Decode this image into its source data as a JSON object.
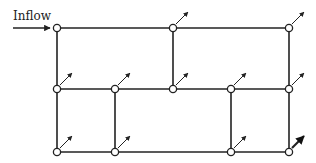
{
  "diagram": {
    "type": "pipe-network",
    "inflow_label": "Inflow",
    "colors": {
      "line": "#222222",
      "node_fill": "#ffffff",
      "background": "#ffffff"
    },
    "nodes": [
      {
        "id": "n1",
        "x": 57,
        "y": 28,
        "outflow": false,
        "inflow": true
      },
      {
        "id": "n2",
        "x": 173,
        "y": 28,
        "outflow": true
      },
      {
        "id": "n3",
        "x": 289,
        "y": 28,
        "outflow": true
      },
      {
        "id": "n4",
        "x": 57,
        "y": 89,
        "outflow": true
      },
      {
        "id": "n5",
        "x": 115,
        "y": 89,
        "outflow": true
      },
      {
        "id": "n6",
        "x": 173,
        "y": 89,
        "outflow": true
      },
      {
        "id": "n7",
        "x": 231,
        "y": 89,
        "outflow": true
      },
      {
        "id": "n8",
        "x": 289,
        "y": 89,
        "outflow": true
      },
      {
        "id": "n9",
        "x": 57,
        "y": 152,
        "outflow": true
      },
      {
        "id": "n10",
        "x": 115,
        "y": 152,
        "outflow": true
      },
      {
        "id": "n11",
        "x": 231,
        "y": 152,
        "outflow": true
      },
      {
        "id": "n12",
        "x": 289,
        "y": 152,
        "outflow": true,
        "bold": true
      }
    ],
    "edges": [
      [
        "n1",
        "n2"
      ],
      [
        "n2",
        "n3"
      ],
      [
        "n1",
        "n4"
      ],
      [
        "n2",
        "n6"
      ],
      [
        "n3",
        "n8"
      ],
      [
        "n4",
        "n5"
      ],
      [
        "n5",
        "n6"
      ],
      [
        "n6",
        "n7"
      ],
      [
        "n7",
        "n8"
      ],
      [
        "n4",
        "n9"
      ],
      [
        "n5",
        "n10"
      ],
      [
        "n7",
        "n11"
      ],
      [
        "n8",
        "n12"
      ],
      [
        "n9",
        "n10"
      ],
      [
        "n10",
        "n11"
      ],
      [
        "n11",
        "n12"
      ]
    ]
  }
}
